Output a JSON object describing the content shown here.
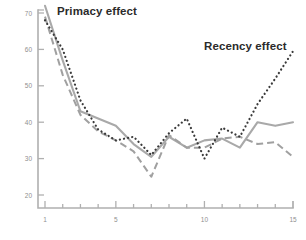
{
  "chart_data": {
    "type": "line",
    "title": "",
    "subtitle": "",
    "xlabel": "",
    "ylabel": "",
    "xlim": [
      0.4,
      15.4
    ],
    "ylim": [
      15,
      71
    ],
    "grid": false,
    "legend_position": "none",
    "x": [
      1,
      2,
      3,
      4,
      5,
      6,
      7,
      8,
      9,
      10,
      11,
      12,
      13,
      14,
      15
    ],
    "xticks": [
      1,
      2,
      3,
      4,
      5,
      6,
      7,
      8,
      9,
      10,
      11,
      12,
      13,
      14,
      15
    ],
    "xtick_labels": [
      "1",
      "",
      "",
      "",
      "5",
      "",
      "",
      "",
      "",
      "10",
      "",
      "",
      "",
      "",
      "15"
    ],
    "yticks": [
      20,
      30,
      40,
      50,
      60,
      70
    ],
    "ytick_labels": [
      "20",
      "30",
      "40",
      "50",
      "60",
      "70"
    ],
    "series": [
      {
        "name": "dotted",
        "style": "dotted",
        "color": "#3a3a3a",
        "values": [
          68,
          60,
          46,
          38,
          35,
          36,
          31,
          37,
          41,
          30,
          38.5,
          36,
          45,
          52,
          59.5
        ]
      },
      {
        "name": "solid",
        "style": "solid",
        "color": "#a9a9a9",
        "values": [
          72,
          57,
          43,
          41,
          39,
          34,
          30.5,
          36,
          33,
          35,
          35.5,
          33,
          40,
          39,
          40
        ]
      },
      {
        "name": "dashed",
        "style": "dashed",
        "color": "#a0a0a0",
        "values": [
          69,
          53,
          42,
          37.5,
          35,
          32,
          25,
          36.5,
          33,
          33,
          35.5,
          36,
          34,
          34.5,
          30.5
        ]
      }
    ],
    "annotations": [
      {
        "id": "primacy",
        "text": "Primacy effect"
      },
      {
        "id": "recency",
        "text": "Recency effect"
      }
    ]
  },
  "annotations": {
    "primacy": "Primacy effect",
    "recency": "Recency effect"
  },
  "colors": {
    "axis": "#b0b0b0",
    "tick_label": "#8f8f8f",
    "annotation_text": "#2b2b2b",
    "background": "#ffffff"
  }
}
